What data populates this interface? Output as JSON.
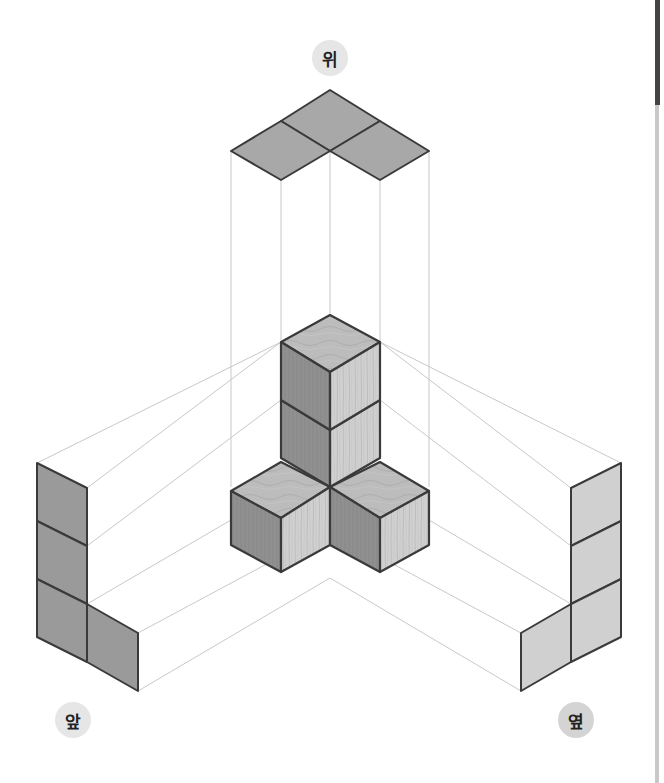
{
  "labels": {
    "top": "위",
    "front": "앞",
    "side": "옆"
  },
  "colors": {
    "view_fill_dark": "#9a9a9a",
    "view_fill_light": "#cfcfcf",
    "cube_top": "#bdbdbd",
    "cube_left": "#8f8f8f",
    "cube_right": "#d2d2d2",
    "edge": "#3a3a3a",
    "guide": "#c4c4c4",
    "badge": "#e6e6e6"
  },
  "diagram": {
    "cube_count": 4,
    "views": [
      "top",
      "front",
      "side"
    ]
  }
}
